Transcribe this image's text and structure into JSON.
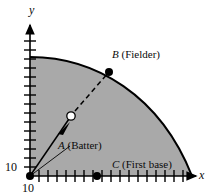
{
  "figure": {
    "name": "baseball-field-quarter-disc-diagram",
    "width": 212,
    "height": 196,
    "background": "#ffffff"
  },
  "axes": {
    "x_label": "x",
    "y_label": "y",
    "x_origin_label": "10",
    "y_origin_label": "10",
    "tick_count_x": 17,
    "tick_count_y": 15,
    "axis_color": "#000000"
  },
  "points": [
    {
      "id": "A",
      "letter": "A",
      "description": "(Batter)",
      "label": "A (Batter)",
      "marker": "filled-dot",
      "x": 30,
      "y": 176
    },
    {
      "id": "B",
      "letter": "B",
      "description": "(Fielder)",
      "label": "B (Fielder)",
      "marker": "filled-dot",
      "x": 109,
      "y": 72
    },
    {
      "id": "C",
      "letter": "C",
      "description": "(First base)",
      "label": "C (First base)",
      "marker": "filled-dot",
      "x": 97,
      "y": 176
    }
  ],
  "ball": {
    "name": "baseball",
    "marker": "open-circle",
    "x": 71,
    "y": 116
  },
  "trajectory": {
    "solid_segment": "batter-to-ball",
    "dashed_segment": "ball-to-fielder",
    "arrow": "direction-of-travel"
  },
  "region": {
    "name": "outfield-quarter-disc",
    "fill": "#a9a9a9",
    "stroke": "#000000"
  },
  "colors": {
    "ink": "#0b0b0b",
    "shade": "#a9a9a9",
    "page": "#ffffff"
  }
}
